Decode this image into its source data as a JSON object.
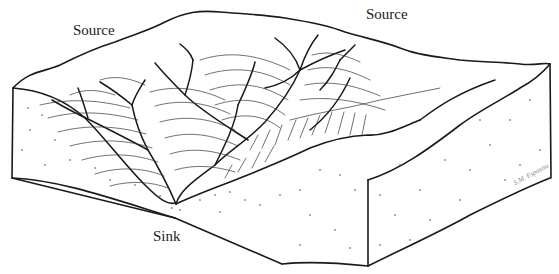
{
  "figure": {
    "type": "block-diagram",
    "labels": {
      "source_left": "Source",
      "source_right": "Source",
      "sink": "Sink"
    },
    "signature": "S.M. Esposito",
    "colors": {
      "line": "#1a1a1a",
      "contour": "#333333",
      "background": "#ffffff",
      "stipple": "#444444"
    }
  }
}
